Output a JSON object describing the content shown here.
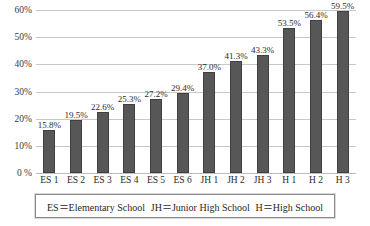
{
  "chart_data": {
    "type": "bar",
    "title": "",
    "xlabel": "",
    "ylabel": "",
    "ylim": [
      0,
      60
    ],
    "grid": true,
    "legend_position": "below-plot",
    "categories": [
      "ES 1",
      "ES 2",
      "ES 3",
      "ES 4",
      "ES 5",
      "ES 6",
      "JH 1",
      "JH 2",
      "JH 3",
      "H 1",
      "H 2",
      "H 3"
    ],
    "values": [
      15.8,
      19.5,
      22.6,
      25.3,
      27.2,
      29.4,
      37.0,
      41.3,
      43.3,
      53.5,
      56.4,
      59.5
    ],
    "data_labels": [
      "15.8%",
      "19.5%",
      "22.6%",
      "25.3%",
      "27.2%",
      "29.4%",
      "37.0%",
      "41.3%",
      "43.3%",
      "53.5%",
      "56.4%",
      "59.5%"
    ],
    "ytick_values": [
      0,
      10,
      20,
      30,
      40,
      50,
      60
    ],
    "ytick_labels": [
      "0 %",
      "10%",
      "20%",
      "30%",
      "40%",
      "50%",
      "60%"
    ],
    "bar_color": "#575757",
    "bar_edge_color": "#404040",
    "grid_color": "#c8c8c8"
  },
  "legend": {
    "entries": [
      "ES＝Elementary School",
      "JH＝Junior High School",
      "H＝High School"
    ]
  }
}
